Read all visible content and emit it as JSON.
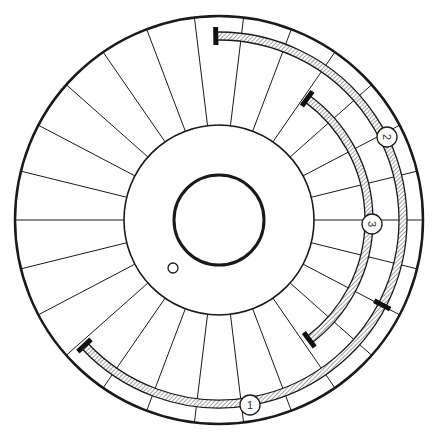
{
  "diagram": {
    "type": "annular-segment-wheel",
    "center": [
      219,
      220
    ],
    "outer_radius": 204,
    "middle_radius": 95,
    "inner_radius": 45,
    "radial_divisions": 26,
    "radial_offset_deg": 0,
    "small_hole": {
      "x": 173,
      "y": 268,
      "r": 5
    },
    "colors": {
      "stroke": "#1a1a1a",
      "background": "#ffffff",
      "hatch": "#444444"
    },
    "bands": [
      {
        "name": "outer-band",
        "radius": 184,
        "width": 8,
        "start_deg": -91,
        "end_deg": 137
      },
      {
        "name": "inner-band",
        "radius": 150,
        "width": 8,
        "start_deg": -54,
        "end_deg": 53
      }
    ],
    "markers": [
      {
        "name": "outer-band-start-marker",
        "radius": 184,
        "angle_deg": -91
      },
      {
        "name": "outer-band-joint-marker",
        "radius": 184,
        "angle_deg": 27.5
      },
      {
        "name": "outer-band-end-marker",
        "radius": 184,
        "angle_deg": 137
      },
      {
        "name": "inner-band-start-marker",
        "radius": 150,
        "angle_deg": -54
      },
      {
        "name": "inner-band-end-marker",
        "radius": 150,
        "angle_deg": 53
      }
    ],
    "labels": [
      {
        "text": "1",
        "x": 250,
        "y": 405,
        "rotate": 0
      },
      {
        "text": "2",
        "x": 387,
        "y": 137,
        "rotate": 90
      },
      {
        "text": "3",
        "x": 372,
        "y": 224,
        "rotate": 90
      }
    ]
  }
}
